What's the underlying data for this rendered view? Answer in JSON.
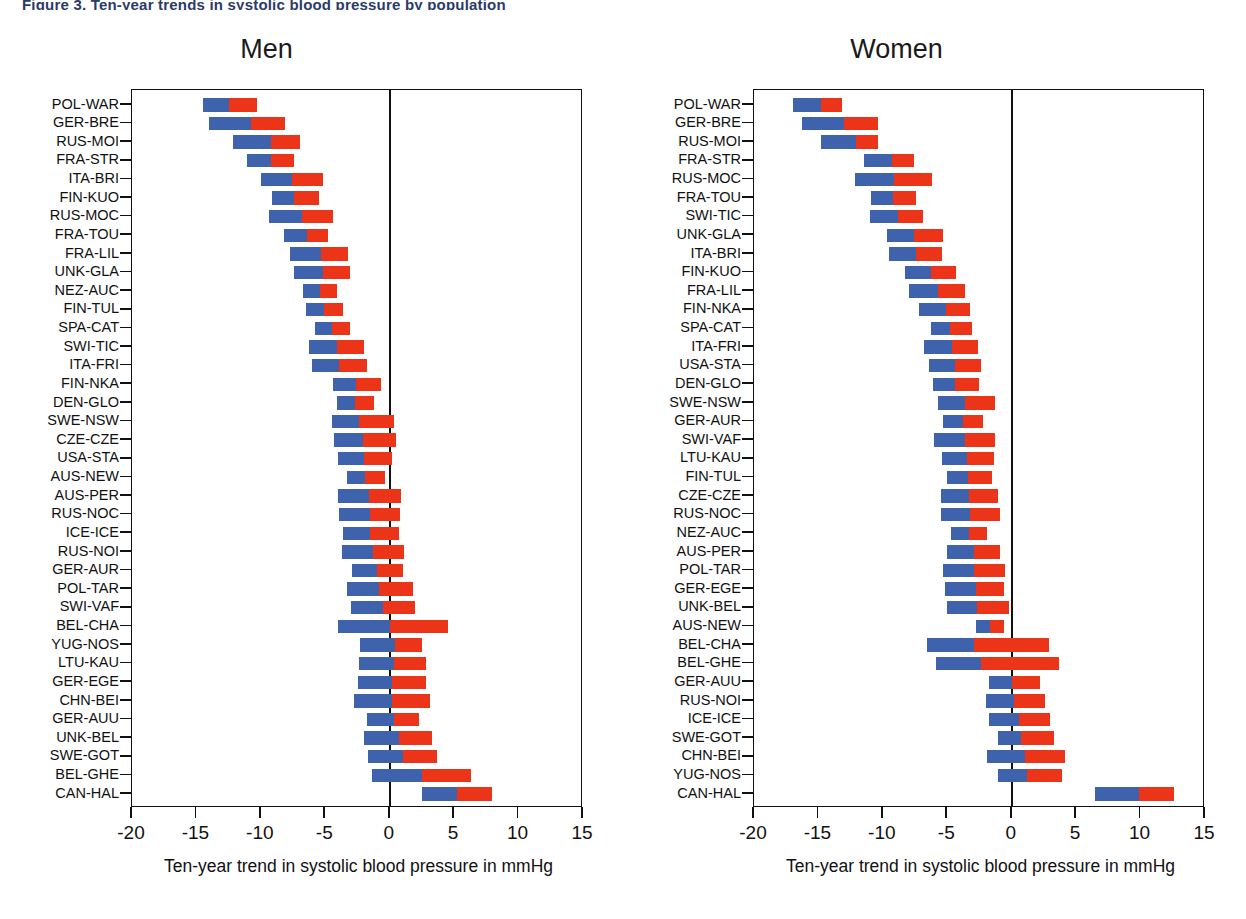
{
  "header": {
    "cropped_text": "Figure 3. Ten-year trends in systolic blood pressure by population"
  },
  "colors": {
    "segment1": "#3e62ab",
    "segment2": "#ec3418",
    "axis": "#111111",
    "background": "#ffffff"
  },
  "chart_data": [
    {
      "type": "bar",
      "orientation": "horizontal",
      "stacked": true,
      "title": "Men",
      "xlabel": "Ten-year trend in systolic blood pressure in mmHg",
      "ylabel": "",
      "xlim": [
        -20,
        15
      ],
      "xticks": [
        -20,
        -15,
        -10,
        -5,
        0,
        5,
        10,
        15
      ],
      "xticklabels": [
        "-20",
        "-15",
        "-10",
        "-5",
        "0",
        "5",
        "10",
        "15"
      ],
      "grid": false,
      "legend": "none",
      "series": [
        {
          "name": "segment-1",
          "color": "#3e62ab"
        },
        {
          "name": "segment-2",
          "color": "#ec3418"
        }
      ],
      "categories": [
        "POL-WAR",
        "GER-BRE",
        "RUS-MOI",
        "FRA-STR",
        "ITA-BRI",
        "FIN-KUO",
        "RUS-MOC",
        "FRA-TOU",
        "FRA-LIL",
        "UNK-GLA",
        "NEZ-AUC",
        "FIN-TUL",
        "SPA-CAT",
        "SWI-TIC",
        "ITA-FRI",
        "FIN-NKA",
        "DEN-GLO",
        "SWE-NSW",
        "CZE-CZE",
        "USA-STA",
        "AUS-NEW",
        "AUS-PER",
        "RUS-NOC",
        "ICE-ICE",
        "RUS-NOI",
        "GER-AUR",
        "POL-TAR",
        "SWI-VAF",
        "BEL-CHA",
        "YUG-NOS",
        "LTU-KAU",
        "GER-EGE",
        "CHN-BEI",
        "GER-AUU",
        "UNK-BEL",
        "SWE-GOT",
        "BEL-GHE",
        "CAN-HAL"
      ],
      "bars": [
        {
          "category": "POL-WAR",
          "start": -14.5,
          "mid": -12.5,
          "end": -10.3
        },
        {
          "category": "GER-BRE",
          "start": -14.0,
          "mid": -10.8,
          "end": -8.1
        },
        {
          "category": "RUS-MOI",
          "start": -12.2,
          "mid": -9.2,
          "end": -7.0
        },
        {
          "category": "FRA-STR",
          "start": -11.1,
          "mid": -9.2,
          "end": -7.4
        },
        {
          "category": "ITA-BRI",
          "start": -10.0,
          "mid": -7.6,
          "end": -5.2
        },
        {
          "category": "FIN-KUO",
          "start": -9.1,
          "mid": -7.4,
          "end": -5.5
        },
        {
          "category": "RUS-MOC",
          "start": -9.4,
          "mid": -6.8,
          "end": -4.4
        },
        {
          "category": "FRA-TOU",
          "start": -8.2,
          "mid": -6.4,
          "end": -4.8
        },
        {
          "category": "FRA-LIL",
          "start": -7.7,
          "mid": -5.3,
          "end": -3.2
        },
        {
          "category": "UNK-GLA",
          "start": -7.4,
          "mid": -5.2,
          "end": -3.1
        },
        {
          "category": "NEZ-AUC",
          "start": -6.7,
          "mid": -5.4,
          "end": -4.1
        },
        {
          "category": "FIN-TUL",
          "start": -6.5,
          "mid": -5.1,
          "end": -3.6
        },
        {
          "category": "SPA-CAT",
          "start": -5.8,
          "mid": -4.5,
          "end": -3.1
        },
        {
          "category": "SWI-TIC",
          "start": -6.3,
          "mid": -4.1,
          "end": -2.0
        },
        {
          "category": "ITA-FRI",
          "start": -6.0,
          "mid": -3.9,
          "end": -1.8
        },
        {
          "category": "FIN-NKA",
          "start": -4.4,
          "mid": -2.6,
          "end": -0.7
        },
        {
          "category": "DEN-GLO",
          "start": -4.1,
          "mid": -2.7,
          "end": -1.2
        },
        {
          "category": "SWE-NSW",
          "start": -4.5,
          "mid": -2.4,
          "end": 0.3
        },
        {
          "category": "CZE-CZE",
          "start": -4.3,
          "mid": -2.1,
          "end": 0.5
        },
        {
          "category": "USA-STA",
          "start": -4.0,
          "mid": -2.0,
          "end": 0.2
        },
        {
          "category": "AUS-NEW",
          "start": -3.3,
          "mid": -1.9,
          "end": -0.4
        },
        {
          "category": "AUS-PER",
          "start": -4.0,
          "mid": -1.6,
          "end": 0.9
        },
        {
          "category": "RUS-NOC",
          "start": -3.9,
          "mid": -1.5,
          "end": 0.8
        },
        {
          "category": "ICE-ICE",
          "start": -3.6,
          "mid": -1.5,
          "end": 0.7
        },
        {
          "category": "RUS-NOI",
          "start": -3.7,
          "mid": -1.3,
          "end": 1.1
        },
        {
          "category": "GER-AUR",
          "start": -2.9,
          "mid": -1.0,
          "end": 1.0
        },
        {
          "category": "POL-TAR",
          "start": -3.3,
          "mid": -0.8,
          "end": 1.8
        },
        {
          "category": "SWI-VAF",
          "start": -3.0,
          "mid": -0.5,
          "end": 2.0
        },
        {
          "category": "BEL-CHA",
          "start": -4.0,
          "mid": 0.0,
          "end": 4.5
        },
        {
          "category": "YUG-NOS",
          "start": -2.3,
          "mid": 0.4,
          "end": 2.5
        },
        {
          "category": "LTU-KAU",
          "start": -2.4,
          "mid": 0.3,
          "end": 2.8
        },
        {
          "category": "GER-EGE",
          "start": -2.5,
          "mid": 0.2,
          "end": 2.8
        },
        {
          "category": "CHN-BEI",
          "start": -2.8,
          "mid": 0.2,
          "end": 3.1
        },
        {
          "category": "GER-AUU",
          "start": -1.8,
          "mid": 0.3,
          "end": 2.3
        },
        {
          "category": "UNK-BEL",
          "start": -2.0,
          "mid": 0.7,
          "end": 3.3
        },
        {
          "category": "SWE-GOT",
          "start": -1.7,
          "mid": 1.0,
          "end": 3.7
        },
        {
          "category": "BEL-GHE",
          "start": -1.4,
          "mid": 2.5,
          "end": 6.3
        },
        {
          "category": "CAN-HAL",
          "start": 2.5,
          "mid": 5.2,
          "end": 7.9
        }
      ]
    },
    {
      "type": "bar",
      "orientation": "horizontal",
      "stacked": true,
      "title": "Women",
      "xlabel": "Ten-year trend in systolic blood pressure in mmHg",
      "ylabel": "",
      "xlim": [
        -20,
        15
      ],
      "xticks": [
        -20,
        -15,
        -10,
        -5,
        0,
        5,
        10,
        15
      ],
      "xticklabels": [
        "-20",
        "-15",
        "-10",
        "-5",
        "0",
        "5",
        "10",
        "15"
      ],
      "grid": false,
      "legend": "none",
      "series": [
        {
          "name": "segment-1",
          "color": "#3e62ab"
        },
        {
          "name": "segment-2",
          "color": "#ec3418"
        }
      ],
      "categories": [
        "POL-WAR",
        "GER-BRE",
        "RUS-MOI",
        "FRA-STR",
        "RUS-MOC",
        "FRA-TOU",
        "SWI-TIC",
        "UNK-GLA",
        "ITA-BRI",
        "FIN-KUO",
        "FRA-LIL",
        "FIN-NKA",
        "SPA-CAT",
        "ITA-FRI",
        "USA-STA",
        "DEN-GLO",
        "SWE-NSW",
        "GER-AUR",
        "SWI-VAF",
        "LTU-KAU",
        "FIN-TUL",
        "CZE-CZE",
        "RUS-NOC",
        "NEZ-AUC",
        "AUS-PER",
        "POL-TAR",
        "GER-EGE",
        "UNK-BEL",
        "AUS-NEW",
        "BEL-CHA",
        "BEL-GHE",
        "GER-AUU",
        "RUS-NOI",
        "ICE-ICE",
        "SWE-GOT",
        "CHN-BEI",
        "YUG-NOS",
        "CAN-HAL"
      ],
      "bars": [
        {
          "category": "POL-WAR",
          "start": -17.0,
          "mid": -14.8,
          "end": -13.2
        },
        {
          "category": "GER-BRE",
          "start": -16.3,
          "mid": -13.0,
          "end": -10.4
        },
        {
          "category": "RUS-MOI",
          "start": -14.8,
          "mid": -12.1,
          "end": -10.4
        },
        {
          "category": "FRA-STR",
          "start": -11.5,
          "mid": -9.3,
          "end": -7.6
        },
        {
          "category": "RUS-MOC",
          "start": -12.2,
          "mid": -9.1,
          "end": -6.2
        },
        {
          "category": "FRA-TOU",
          "start": -10.9,
          "mid": -9.2,
          "end": -7.4
        },
        {
          "category": "SWI-TIC",
          "start": -11.0,
          "mid": -8.8,
          "end": -6.9
        },
        {
          "category": "UNK-GLA",
          "start": -9.7,
          "mid": -7.6,
          "end": -5.3
        },
        {
          "category": "ITA-BRI",
          "start": -9.5,
          "mid": -7.4,
          "end": -5.4
        },
        {
          "category": "FIN-KUO",
          "start": -8.3,
          "mid": -6.3,
          "end": -4.3
        },
        {
          "category": "FRA-LIL",
          "start": -8.0,
          "mid": -5.7,
          "end": -3.6
        },
        {
          "category": "FIN-NKA",
          "start": -7.2,
          "mid": -5.1,
          "end": -3.2
        },
        {
          "category": "SPA-CAT",
          "start": -6.3,
          "mid": -4.8,
          "end": -3.1
        },
        {
          "category": "ITA-FRI",
          "start": -6.8,
          "mid": -4.6,
          "end": -2.6
        },
        {
          "category": "USA-STA",
          "start": -6.4,
          "mid": -4.4,
          "end": -2.4
        },
        {
          "category": "DEN-GLO",
          "start": -6.1,
          "mid": -4.4,
          "end": -2.5
        },
        {
          "category": "SWE-NSW",
          "start": -5.7,
          "mid": -3.6,
          "end": -1.3
        },
        {
          "category": "GER-AUR",
          "start": -5.3,
          "mid": -3.8,
          "end": -2.2
        },
        {
          "category": "SWI-VAF",
          "start": -6.0,
          "mid": -3.6,
          "end": -1.3
        },
        {
          "category": "LTU-KAU",
          "start": -5.4,
          "mid": -3.5,
          "end": -1.4
        },
        {
          "category": "FIN-TUL",
          "start": -5.0,
          "mid": -3.4,
          "end": -1.5
        },
        {
          "category": "CZE-CZE",
          "start": -5.5,
          "mid": -3.3,
          "end": -1.1
        },
        {
          "category": "RUS-NOC",
          "start": -5.5,
          "mid": -3.2,
          "end": -0.9
        },
        {
          "category": "NEZ-AUC",
          "start": -4.7,
          "mid": -3.3,
          "end": -1.9
        },
        {
          "category": "AUS-PER",
          "start": -5.0,
          "mid": -2.9,
          "end": -0.9
        },
        {
          "category": "POL-TAR",
          "start": -5.3,
          "mid": -2.9,
          "end": -0.5
        },
        {
          "category": "GER-EGE",
          "start": -5.2,
          "mid": -2.8,
          "end": -0.6
        },
        {
          "category": "UNK-BEL",
          "start": -5.0,
          "mid": -2.7,
          "end": -0.2
        },
        {
          "category": "AUS-NEW",
          "start": -2.8,
          "mid": -1.7,
          "end": -0.6
        },
        {
          "category": "BEL-CHA",
          "start": -6.6,
          "mid": -2.9,
          "end": 2.9
        },
        {
          "category": "BEL-GHE",
          "start": -5.9,
          "mid": -2.4,
          "end": 3.7
        },
        {
          "category": "GER-AUU",
          "start": -1.8,
          "mid": 0.0,
          "end": 2.2
        },
        {
          "category": "RUS-NOI",
          "start": -2.0,
          "mid": 0.2,
          "end": 2.6
        },
        {
          "category": "ICE-ICE",
          "start": -1.8,
          "mid": 0.6,
          "end": 3.0
        },
        {
          "category": "SWE-GOT",
          "start": -1.1,
          "mid": 0.7,
          "end": 3.3
        },
        {
          "category": "CHN-BEI",
          "start": -1.9,
          "mid": 1.0,
          "end": 4.1
        },
        {
          "category": "YUG-NOS",
          "start": -1.1,
          "mid": 1.2,
          "end": 3.9
        },
        {
          "category": "CAN-HAL",
          "start": 6.5,
          "mid": 9.9,
          "end": 12.6
        }
      ]
    }
  ]
}
